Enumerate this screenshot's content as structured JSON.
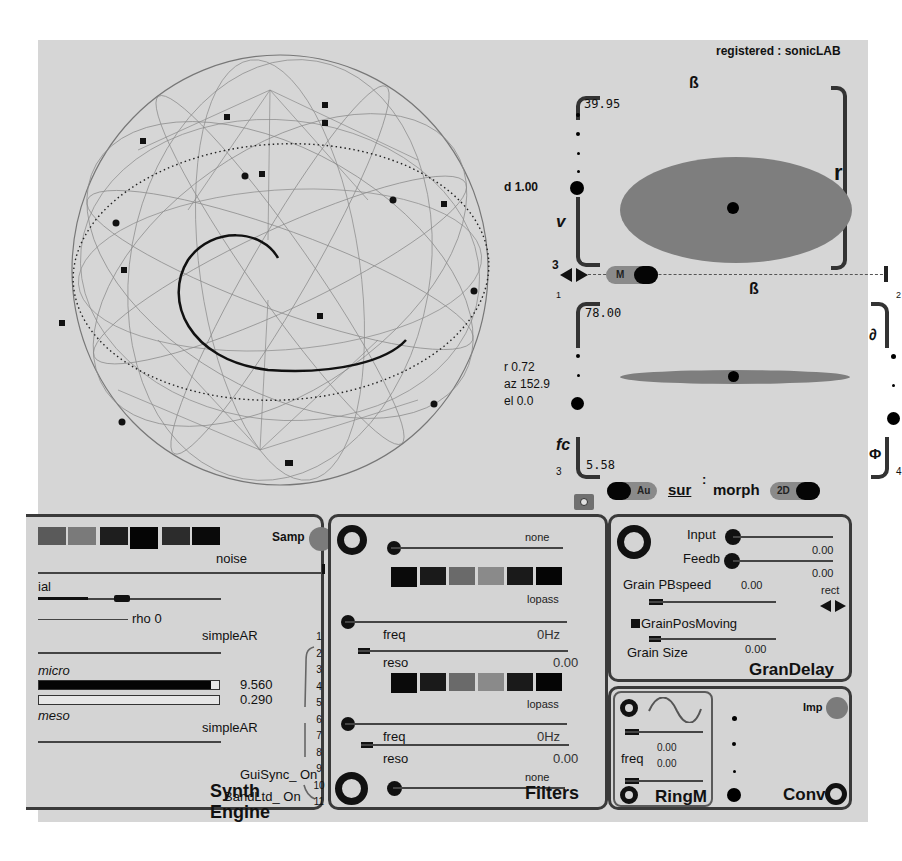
{
  "registration": "registered : sonicLAB",
  "sphere": {
    "label": "HOA/ambisonic 3D",
    "speaker_count": 14
  },
  "spatial_panel": {
    "top_box": {
      "title": "ß",
      "value": "39.95",
      "left_label": "v",
      "right_label": "r",
      "distance_readout": "d 1.00",
      "corner_number_left": "3"
    },
    "transport": {
      "mode_toggle_label": "M",
      "corner_left": "1",
      "corner_right": "2"
    },
    "bottom_box": {
      "title": "ß",
      "value_top": "78.00",
      "value_bottom": "5.58",
      "right_top_label": "∂",
      "left_bottom_label": "fc",
      "right_bottom_label": "Φ",
      "corner_left": "3",
      "corner_right": "4",
      "readouts": {
        "r": "r 0.72",
        "az": "az 152.9",
        "el": "el 0.0"
      }
    },
    "footer": {
      "auto_toggle_label": "Au",
      "sur_label": "sur",
      "separator": ":",
      "morph_label": "morph",
      "dim_toggle_label": "2D"
    }
  },
  "synth_engine": {
    "title": "Synth Engine",
    "samp_label": "Samp",
    "noise_label": "noise",
    "partial_label": "ial",
    "rho_label": "rho 0",
    "env1_label": "simpleAR",
    "micro_label": "micro",
    "micro_value": "9.560",
    "meso_value": "0.290",
    "meso_label": "meso",
    "env2_label": "simpleAR",
    "gui_sync": "GuiSync_ On",
    "band_ltd": "BandLtd_ On",
    "channel_numbers": [
      "1",
      "2",
      "3",
      "4",
      "5",
      "6",
      "7",
      "8",
      "9",
      "10",
      "11"
    ],
    "swatch_colors": [
      "#5a5a5a",
      "#7a7a7a",
      "#8a8a8a",
      "#1e1e1e",
      "#050505",
      "#2c2c2c",
      "#0a0a0a"
    ]
  },
  "filters": {
    "title": "Filters",
    "input_label": "none",
    "filter1": {
      "type": "lopass",
      "freq_label": "freq",
      "freq_value": "0Hz",
      "reso_label": "reso",
      "reso_value": "0.00"
    },
    "filter2": {
      "type": "lopass",
      "freq_label": "freq",
      "freq_value": "0Hz",
      "reso_label": "reso",
      "reso_value": "0.00"
    },
    "output_label": "none",
    "swatch_colors": [
      "#0a0a0a",
      "#1a1a1a",
      "#6a6a6a",
      "#8a8a8a",
      "#1a1a1a",
      "#050505"
    ]
  },
  "gran_delay": {
    "title": "GranDelay",
    "input_label": "Input",
    "input_value": "0.00",
    "feedback_label": "Feedb",
    "feedback_value": "0.00",
    "pbspeed_label": "Grain PBspeed",
    "pbspeed_value": "0.00",
    "window_label": "rect",
    "pos_moving_label": "GrainPosMoving",
    "size_label": "Grain Size",
    "size_value": "0.00"
  },
  "ring_mod": {
    "title": "RingM",
    "freq_label": "freq",
    "freq_value_1": "0.00",
    "freq_value_2": "0.00"
  },
  "convolution": {
    "title": "Conv",
    "imp_label": "Imp"
  },
  "colors": {
    "panel_bg": "#d6d6d6",
    "ellipse": "#7e7e7e",
    "button_grey": "#8a8a8a",
    "led_grey": "#7b7b7b"
  }
}
